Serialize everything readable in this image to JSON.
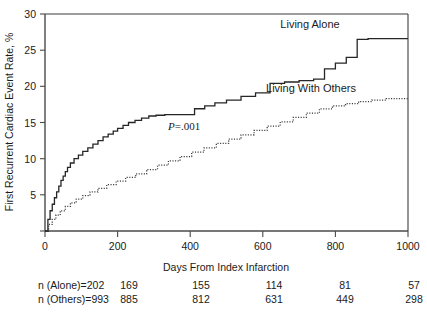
{
  "chart_data": {
    "type": "line",
    "title": "",
    "xlabel": "Days From Index Infarction",
    "ylabel": "First Recurrent Cardiac Event Rate, %",
    "xlim": [
      0,
      1000
    ],
    "ylim": [
      0,
      30
    ],
    "xticks": [
      0,
      200,
      400,
      600,
      800,
      1000
    ],
    "xticklabels": [
      "0",
      "200",
      "400",
      "600",
      "800",
      "1000"
    ],
    "yticks": [
      0,
      5,
      10,
      15,
      20,
      25,
      30
    ],
    "yticklabels": [
      "",
      "5",
      "10",
      "15",
      "20",
      "25",
      "30"
    ],
    "grid": false,
    "legend_position": "inline-annotation",
    "annotations": [
      {
        "text": "P=.001",
        "x": 390,
        "y": 14.6
      },
      {
        "text": "Living Alone",
        "x": 720,
        "y": 27.9
      },
      {
        "text": "Living With Others",
        "x": 700,
        "y": 21.0
      }
    ],
    "series": [
      {
        "name": "Living Alone",
        "style": "solid",
        "x": [
          0,
          8,
          14,
          20,
          26,
          32,
          38,
          44,
          50,
          56,
          62,
          70,
          80,
          92,
          104,
          118,
          132,
          146,
          160,
          174,
          188,
          200,
          215,
          230,
          248,
          266,
          286,
          306,
          330,
          356,
          384,
          412,
          440,
          468,
          500,
          540,
          580,
          620,
          660,
          700,
          740,
          770,
          800,
          830,
          860,
          890,
          1000
        ],
        "y": [
          0,
          1.6,
          2.8,
          3.7,
          4.6,
          5.4,
          6.2,
          7.0,
          7.6,
          8.2,
          8.8,
          9.4,
          10.0,
          10.5,
          11.0,
          11.5,
          12.0,
          12.5,
          13.0,
          13.4,
          13.8,
          14.2,
          14.6,
          15.0,
          15.3,
          15.6,
          15.9,
          16.0,
          16.1,
          16.1,
          16.1,
          16.9,
          17.3,
          17.7,
          18.1,
          18.6,
          19.1,
          20.4,
          20.6,
          20.8,
          21.0,
          22.4,
          23.2,
          24.0,
          26.5,
          26.6,
          26.6
        ]
      },
      {
        "name": "Living With Others",
        "style": "dotted",
        "x": [
          0,
          10,
          20,
          30,
          42,
          56,
          70,
          86,
          104,
          124,
          146,
          170,
          196,
          222,
          250,
          280,
          310,
          340,
          372,
          404,
          438,
          472,
          506,
          540,
          576,
          612,
          648,
          684,
          720,
          756,
          792,
          828,
          864,
          900,
          940,
          1000
        ],
        "y": [
          0,
          0.9,
          1.6,
          2.2,
          2.8,
          3.4,
          3.9,
          4.4,
          4.9,
          5.4,
          5.9,
          6.4,
          6.9,
          7.4,
          7.9,
          8.5,
          9.1,
          9.7,
          10.3,
          10.9,
          11.5,
          12.1,
          12.7,
          13.3,
          13.9,
          14.5,
          15.1,
          15.7,
          16.3,
          16.9,
          17.3,
          17.6,
          17.9,
          18.1,
          18.3,
          18.4
        ]
      }
    ],
    "risk_table": {
      "rows": [
        {
          "label": "n (Alone)=202",
          "values": [
            "169",
            "155",
            "114",
            "81",
            "57"
          ]
        },
        {
          "label": "n (Others)=993",
          "values": [
            "885",
            "812",
            "631",
            "449",
            "298"
          ]
        }
      ],
      "value_x_positions": [
        200,
        400,
        600,
        800,
        1000
      ]
    }
  },
  "colors": {
    "axis": "#4a4a4a",
    "solid_curve": "#262626",
    "dotted_curve": "#3a3a3a",
    "text": "#1a1a1a",
    "background": "#ffffff"
  }
}
